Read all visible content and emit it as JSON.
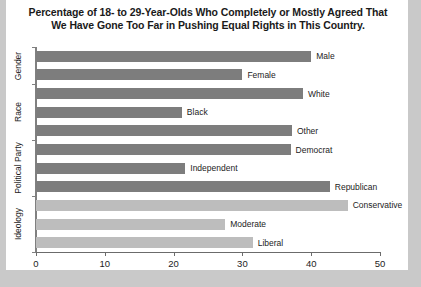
{
  "chart_data": {
    "type": "bar",
    "orientation": "horizontal",
    "title": "Percentage of 18- to 29-Year-Olds Who Completely or Mostly Agreed That We Have Gone Too Far in Pushing Equal Rights in This Country.",
    "title_line1": "Percentage of 18- to 29-Year-Olds Who Completely or Mostly Agreed That",
    "title_line2": "We Have Gone Too Far in Pushing Equal Rights in This Country.",
    "xlabel": "",
    "ylabel": "",
    "xlim": [
      0,
      50
    ],
    "xticks": [
      0,
      10,
      20,
      30,
      40,
      50
    ],
    "xtick_labels": [
      "0",
      "10",
      "20",
      "30",
      "40",
      "50"
    ],
    "grid": false,
    "legend": "none",
    "categories": [
      "Male",
      "Female",
      "White",
      "Black",
      "Other",
      "Democrat",
      "Independent",
      "Republican",
      "Conservative",
      "Moderate",
      "Liberal"
    ],
    "values": [
      40.0,
      30.0,
      38.8,
      21.2,
      37.2,
      37.0,
      21.7,
      42.7,
      45.3,
      27.5,
      31.5
    ],
    "bar_colors": [
      "#7d7d7d",
      "#7d7d7d",
      "#7d7d7d",
      "#7d7d7d",
      "#7d7d7d",
      "#7d7d7d",
      "#7d7d7d",
      "#7d7d7d",
      "#bdbdbd",
      "#bdbdbd",
      "#bdbdbd"
    ],
    "groups": [
      {
        "label": "Gender",
        "categories": [
          "Male",
          "Female"
        ]
      },
      {
        "label": "Race",
        "categories": [
          "White",
          "Black",
          "Other"
        ]
      },
      {
        "label": "Political Party",
        "categories": [
          "Democrat",
          "Independent",
          "Republican"
        ]
      },
      {
        "label": "Ideology",
        "categories": [
          "Conservative",
          "Moderate",
          "Liberal"
        ]
      }
    ],
    "bars": [
      {
        "label": "Male",
        "value": 40.0,
        "group": "Gender",
        "shade": "dark"
      },
      {
        "label": "Female",
        "value": 30.0,
        "group": "Gender",
        "shade": "dark"
      },
      {
        "label": "White",
        "value": 38.8,
        "group": "Race",
        "shade": "dark"
      },
      {
        "label": "Black",
        "value": 21.2,
        "group": "Race",
        "shade": "dark"
      },
      {
        "label": "Other",
        "value": 37.2,
        "group": "Race",
        "shade": "dark"
      },
      {
        "label": "Democrat",
        "value": 37.0,
        "group": "Political Party",
        "shade": "dark"
      },
      {
        "label": "Independent",
        "value": 21.7,
        "group": "Political Party",
        "shade": "dark"
      },
      {
        "label": "Republican",
        "value": 42.7,
        "group": "Political Party",
        "shade": "dark"
      },
      {
        "label": "Conservative",
        "value": 45.3,
        "group": "Ideology",
        "shade": "light"
      },
      {
        "label": "Moderate",
        "value": 27.5,
        "group": "Ideology",
        "shade": "light"
      },
      {
        "label": "Liberal",
        "value": 31.5,
        "group": "Ideology",
        "shade": "light"
      }
    ]
  },
  "group_labels": [
    "Gender",
    "Race",
    "Political Party",
    "Ideology"
  ],
  "colors": {
    "bar_dark": "#7d7d7d",
    "bar_light": "#bdbdbd",
    "axis": "#808080",
    "text": "#1c1c1c",
    "paper": "#ffffff",
    "page_background": "#c9c9c9"
  }
}
